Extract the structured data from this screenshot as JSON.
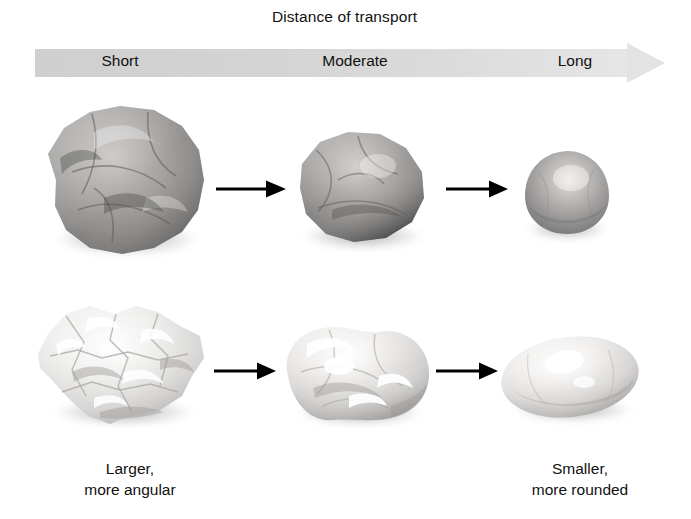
{
  "header": {
    "title": "Distance of transport",
    "scale_labels": [
      {
        "key": "short",
        "label": "Short"
      },
      {
        "key": "moderate",
        "label": "Moderate"
      },
      {
        "key": "long",
        "label": "Long"
      }
    ],
    "arrow_direction": "right",
    "bar_color_start": "#cfcfcf",
    "bar_color_end": "#e6e6e6"
  },
  "rows": [
    {
      "name": "dark-rock-row",
      "stages": [
        {
          "stage": "short",
          "shape": "angular-blocky",
          "tone": "dark-gray",
          "size": "large"
        },
        {
          "stage": "moderate",
          "shape": "subrounded",
          "tone": "dark-gray",
          "size": "medium"
        },
        {
          "stage": "long",
          "shape": "rounded-sphere",
          "tone": "medium-gray",
          "size": "small"
        }
      ]
    },
    {
      "name": "light-rock-row",
      "stages": [
        {
          "stage": "short",
          "shape": "very-angular",
          "tone": "light-gray",
          "size": "large"
        },
        {
          "stage": "moderate",
          "shape": "subrounded-lobed",
          "tone": "light-gray",
          "size": "medium"
        },
        {
          "stage": "long",
          "shape": "rounded-ellipse",
          "tone": "light-gray",
          "size": "small"
        }
      ]
    }
  ],
  "captions": {
    "left_line1": "Larger,",
    "left_line2": "more angular",
    "right_line1": "Smaller,",
    "right_line2": "more rounded"
  },
  "icons": {
    "flow_arrow": "arrow-right-icon",
    "scale_arrow": "gradient-arrow-right-icon"
  }
}
